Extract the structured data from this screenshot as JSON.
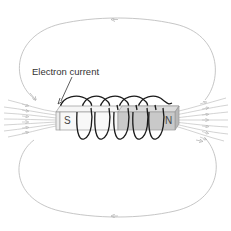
{
  "diagram": {
    "label_current": "Electron current",
    "pole_south": "S",
    "pole_north": "N",
    "colors": {
      "field_lines": "#b5b5b5",
      "coil": "#1a1a1a",
      "core_light": "#f4f4f4",
      "core_dark": "#c8c8c8",
      "core_outline": "#9a9a9a",
      "text": "#333333"
    },
    "coil_turns": 5,
    "field_arrow_direction_outer": "right-to-left (N to S outside)"
  }
}
